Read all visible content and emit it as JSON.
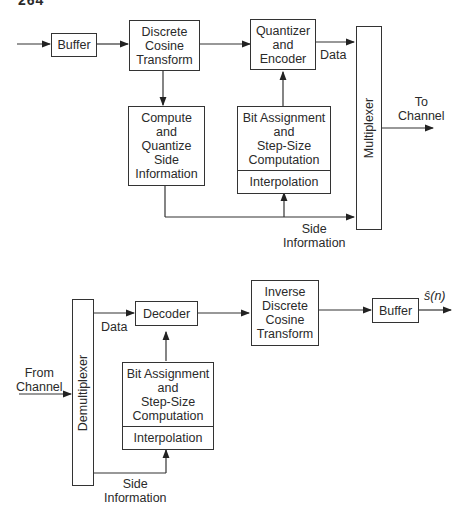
{
  "page_number": "264",
  "encoder": {
    "buffer": "Buffer",
    "dct": [
      "Discrete",
      "Cosine",
      "Transform"
    ],
    "quantizer": [
      "Quantizer",
      "and",
      "Encoder"
    ],
    "side_info_compute": [
      "Compute",
      "and",
      "Quantize",
      "Side",
      "Information"
    ],
    "bit_assignment": [
      "Bit Assignment",
      "and",
      "Step-Size",
      "Computation"
    ],
    "interpolation": "Interpolation",
    "multiplexer": "Multiplexer",
    "data_label": "Data",
    "side_info_label": [
      "Side",
      "Information"
    ],
    "output_label": [
      "To",
      "Channel"
    ]
  },
  "decoder": {
    "demultiplexer": "Demultiplexer",
    "input_label": [
      "From",
      "Channel"
    ],
    "data_label": "Data",
    "decoder": "Decoder",
    "idct": [
      "Inverse",
      "Discrete",
      "Cosine",
      "Transform"
    ],
    "buffer": "Buffer",
    "output_label": "ŝ(n)",
    "bit_assignment": [
      "Bit Assignment",
      "and",
      "Step-Size",
      "Computation"
    ],
    "interpolation": "Interpolation",
    "side_info_label": [
      "Side",
      "Information"
    ]
  }
}
